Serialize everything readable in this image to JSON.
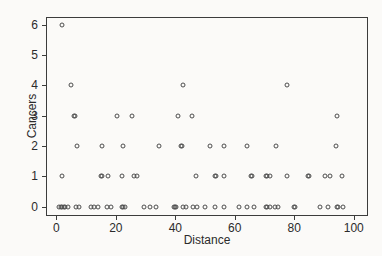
{
  "chart_data": {
    "type": "scatter",
    "title": "",
    "xlabel": "Distance",
    "ylabel": "Cancers",
    "xlim": [
      -3.5,
      104.8
    ],
    "ylim": [
      -0.31,
      6.26
    ],
    "xticks": [
      0,
      20,
      40,
      60,
      80,
      100
    ],
    "yticks": [
      0,
      1,
      2,
      3,
      4,
      5,
      6
    ],
    "grid": false,
    "legend": null,
    "marker": "open-circle",
    "marker_color": "#4d4d4d",
    "points": [
      [
        2,
        6
      ],
      [
        5,
        4
      ],
      [
        42.5,
        4
      ],
      [
        77.5,
        4
      ],
      [
        6,
        3
      ],
      [
        6.3,
        3
      ],
      [
        20.5,
        3
      ],
      [
        25.5,
        3
      ],
      [
        41,
        3
      ],
      [
        45.5,
        3
      ],
      [
        94.5,
        3
      ],
      [
        7,
        2
      ],
      [
        15.5,
        2
      ],
      [
        22.5,
        2
      ],
      [
        34.5,
        2
      ],
      [
        42,
        2
      ],
      [
        42.4,
        2
      ],
      [
        51.5,
        2
      ],
      [
        56.5,
        2
      ],
      [
        64,
        2
      ],
      [
        74,
        2
      ],
      [
        94,
        2
      ],
      [
        2,
        1
      ],
      [
        15,
        1
      ],
      [
        15.3,
        1
      ],
      [
        17.5,
        1
      ],
      [
        22,
        1
      ],
      [
        26,
        1
      ],
      [
        27,
        1
      ],
      [
        47,
        1
      ],
      [
        53.5,
        1
      ],
      [
        53.8,
        1
      ],
      [
        56.5,
        1
      ],
      [
        65.5,
        1
      ],
      [
        65.8,
        1
      ],
      [
        70.5,
        1
      ],
      [
        70.8,
        1
      ],
      [
        72,
        1
      ],
      [
        77.5,
        1
      ],
      [
        84.5,
        1
      ],
      [
        84.8,
        1
      ],
      [
        90.5,
        1
      ],
      [
        92,
        1
      ],
      [
        96,
        1
      ],
      [
        1,
        0
      ],
      [
        1.5,
        0
      ],
      [
        2,
        0
      ],
      [
        2.5,
        0
      ],
      [
        3,
        0
      ],
      [
        4,
        0
      ],
      [
        6.5,
        0
      ],
      [
        7.5,
        0
      ],
      [
        11.5,
        0
      ],
      [
        12.5,
        0
      ],
      [
        14,
        0
      ],
      [
        17,
        0
      ],
      [
        18.5,
        0
      ],
      [
        22,
        0
      ],
      [
        22.5,
        0
      ],
      [
        23,
        0
      ],
      [
        29.5,
        0
      ],
      [
        31.5,
        0
      ],
      [
        33.5,
        0
      ],
      [
        39.5,
        0
      ],
      [
        40,
        0
      ],
      [
        40.3,
        0
      ],
      [
        42.5,
        0
      ],
      [
        43.5,
        0
      ],
      [
        46,
        0
      ],
      [
        47.3,
        0
      ],
      [
        50,
        0
      ],
      [
        53.5,
        0
      ],
      [
        56.5,
        0
      ],
      [
        61.5,
        0
      ],
      [
        64,
        0
      ],
      [
        66.5,
        0
      ],
      [
        70.5,
        0
      ],
      [
        70.8,
        0
      ],
      [
        72,
        0
      ],
      [
        73.5,
        0
      ],
      [
        74.5,
        0
      ],
      [
        80,
        0
      ],
      [
        80.3,
        0
      ],
      [
        88.5,
        0
      ],
      [
        91.5,
        0
      ],
      [
        94.5,
        0
      ],
      [
        94.8,
        0
      ],
      [
        96.5,
        0
      ]
    ]
  },
  "colors": {
    "background": "#fbfaf8",
    "frame": "#3c3c3c",
    "text": "#2b2b2b",
    "marker": "#4d4d4d"
  }
}
